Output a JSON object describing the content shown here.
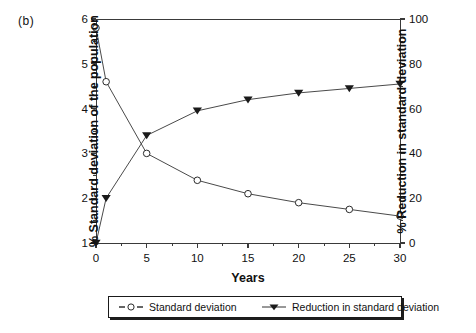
{
  "panel": {
    "label": "(b)"
  },
  "chart_data": {
    "type": "line",
    "title": "",
    "xlabel": "Years",
    "ylabel": "% Standard deviation of the population",
    "y2label": "% Reduction in standard deviation",
    "x": [
      0,
      1,
      5,
      10,
      15,
      20,
      25,
      30
    ],
    "xlim": [
      0,
      30
    ],
    "ylim": [
      1,
      6
    ],
    "y2lim": [
      0,
      100
    ],
    "xticks": [
      0,
      5,
      10,
      15,
      20,
      25,
      30
    ],
    "xtick_labels": [
      "0",
      "5",
      "10",
      "15",
      "20",
      "25",
      "30"
    ],
    "yticks": [
      1,
      2,
      3,
      4,
      5,
      6
    ],
    "ytick_labels": [
      "1",
      "2",
      "3",
      "4",
      "5",
      "6"
    ],
    "y2ticks": [
      0,
      20,
      40,
      60,
      80,
      100
    ],
    "y2tick_labels": [
      "0",
      "20",
      "40",
      "60",
      "80",
      "100"
    ],
    "grid": false,
    "legend_position": "below-center",
    "series": [
      {
        "name": "Standard deviation",
        "axis": "left",
        "marker": "open-circle",
        "values": [
          5.8,
          4.6,
          3.0,
          2.4,
          2.1,
          1.9,
          1.75,
          1.6
        ]
      },
      {
        "name": "Reduction in standard deviation",
        "axis": "right",
        "marker": "filled-triangle-down",
        "values": [
          0,
          20,
          48,
          59,
          64,
          67,
          69,
          71
        ]
      }
    ]
  },
  "colors": {
    "axis": "#3a3a3a",
    "line": "#4a4a4a",
    "marker_fill": "#ffffff",
    "marker_stroke": "#2b2b2b",
    "triangle": "#1a1a1a",
    "background": "#ffffff"
  },
  "legend": {
    "items": [
      {
        "label": "Standard deviation",
        "marker": "open-circle-icon"
      },
      {
        "label": "Reduction in standard deviation",
        "marker": "filled-triangle-icon"
      }
    ]
  }
}
